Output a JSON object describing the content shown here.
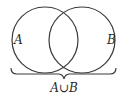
{
  "diagram": {
    "type": "venn",
    "sets": [
      {
        "label": "A",
        "cx": 45,
        "cy": 40,
        "r": 33
      },
      {
        "label": "B",
        "cx": 82,
        "cy": 40,
        "r": 33
      }
    ],
    "brace_label": "A∪B",
    "colors": {
      "stroke": "#3a3a3a",
      "text": "#2a2a2a",
      "background": "#ffffff"
    }
  }
}
